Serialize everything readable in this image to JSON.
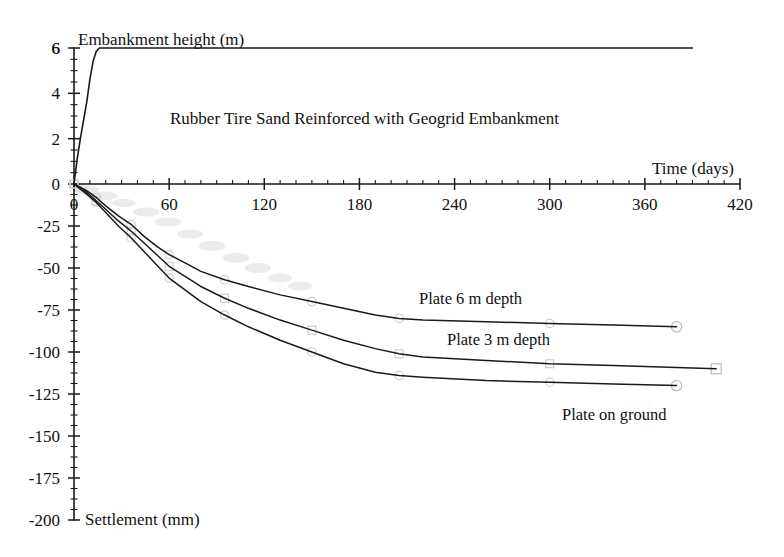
{
  "chart_data": {
    "type": "line",
    "title": "Rubber Tire Sand Reinforced with Geogrid Embankment",
    "xlabel": "Time (days)",
    "ylabel_top": "Embankment height (m)",
    "ylabel_bottom": "Settlement (mm)",
    "grid": false,
    "legend_position": "inline-annotations",
    "xlim": [
      0,
      420
    ],
    "x_ticks": [
      0,
      60,
      120,
      180,
      240,
      300,
      360,
      420
    ],
    "x_minor_step": 10,
    "y_top_axis": {
      "label": "Embankment height (m)",
      "lim": [
        0,
        6
      ],
      "ticks": [
        0,
        2,
        4,
        6
      ],
      "minor_step": 0.5
    },
    "y_bottom_axis": {
      "label": "Settlement (mm)",
      "lim": [
        -200,
        0
      ],
      "ticks": [
        0,
        -25,
        -50,
        -75,
        -100,
        -125,
        -150,
        -175,
        -200
      ],
      "minor_step": 6.25
    },
    "series": [
      {
        "name": "Embankment height",
        "axis": "top",
        "unit": "m",
        "marker": "none",
        "points": [
          [
            0,
            0.0
          ],
          [
            2,
            1.1
          ],
          [
            4,
            2.0
          ],
          [
            6,
            2.8
          ],
          [
            8,
            3.6
          ],
          [
            10,
            4.6
          ],
          [
            12,
            5.4
          ],
          [
            14,
            5.85
          ],
          [
            16,
            6.0
          ],
          [
            30,
            6.0
          ],
          [
            60,
            6.0
          ],
          [
            120,
            6.0
          ],
          [
            180,
            6.0
          ],
          [
            240,
            6.0
          ],
          [
            300,
            6.0
          ],
          [
            360,
            6.0
          ],
          [
            390,
            6.0
          ]
        ]
      },
      {
        "name": "Plate 6 m depth",
        "axis": "bottom",
        "unit": "mm",
        "marker": "circle",
        "label": "Plate 6 m depth",
        "points": [
          [
            0,
            0
          ],
          [
            4,
            -2
          ],
          [
            8,
            -4
          ],
          [
            14,
            -8
          ],
          [
            20,
            -13
          ],
          [
            28,
            -19
          ],
          [
            36,
            -24
          ],
          [
            44,
            -31
          ],
          [
            52,
            -37
          ],
          [
            60,
            -42
          ],
          [
            70,
            -47
          ],
          [
            80,
            -52
          ],
          [
            95,
            -57
          ],
          [
            110,
            -61
          ],
          [
            130,
            -66
          ],
          [
            150,
            -70
          ],
          [
            170,
            -74
          ],
          [
            190,
            -78
          ],
          [
            205,
            -80
          ],
          [
            220,
            -81
          ],
          [
            260,
            -82
          ],
          [
            300,
            -83
          ],
          [
            340,
            -84
          ],
          [
            380,
            -85
          ]
        ]
      },
      {
        "name": "Plate 3 m depth",
        "axis": "bottom",
        "unit": "mm",
        "marker": "square",
        "label": "Plate 3 m depth",
        "points": [
          [
            0,
            0
          ],
          [
            4,
            -2
          ],
          [
            8,
            -5
          ],
          [
            14,
            -10
          ],
          [
            20,
            -15
          ],
          [
            28,
            -22
          ],
          [
            36,
            -28
          ],
          [
            44,
            -35
          ],
          [
            52,
            -42
          ],
          [
            60,
            -49
          ],
          [
            70,
            -55
          ],
          [
            80,
            -61
          ],
          [
            95,
            -68
          ],
          [
            110,
            -74
          ],
          [
            130,
            -81
          ],
          [
            150,
            -87
          ],
          [
            170,
            -93
          ],
          [
            190,
            -98
          ],
          [
            205,
            -101
          ],
          [
            220,
            -103
          ],
          [
            260,
            -105
          ],
          [
            300,
            -107
          ],
          [
            340,
            -108
          ],
          [
            405,
            -110
          ]
        ]
      },
      {
        "name": "Plate on ground",
        "axis": "bottom",
        "unit": "mm",
        "marker": "circle",
        "label": "Plate on ground",
        "points": [
          [
            0,
            0
          ],
          [
            4,
            -3
          ],
          [
            8,
            -6
          ],
          [
            14,
            -11
          ],
          [
            20,
            -17
          ],
          [
            28,
            -25
          ],
          [
            36,
            -32
          ],
          [
            44,
            -40
          ],
          [
            52,
            -48
          ],
          [
            60,
            -56
          ],
          [
            70,
            -63
          ],
          [
            80,
            -70
          ],
          [
            95,
            -78
          ],
          [
            110,
            -85
          ],
          [
            130,
            -93
          ],
          [
            150,
            -100
          ],
          [
            170,
            -107
          ],
          [
            190,
            -112
          ],
          [
            205,
            -114
          ],
          [
            220,
            -115
          ],
          [
            260,
            -117
          ],
          [
            300,
            -118
          ],
          [
            340,
            -119
          ],
          [
            380,
            -120
          ]
        ]
      }
    ],
    "annotations": [
      {
        "text": "Rubber Tire Sand Reinforced with Geogrid Embankment",
        "x": 170,
        "y": 124,
        "name": "chart-title"
      },
      {
        "text": "Embankment height (m)",
        "x": 78,
        "y": 45,
        "name": "top-axis-caption"
      },
      {
        "text": "Time (days)",
        "x": 652,
        "y": 174,
        "name": "x-axis-caption"
      },
      {
        "text": "Settlement (mm)",
        "x": 85,
        "y": 525,
        "name": "bottom-axis-caption"
      },
      {
        "text": "Plate 6 m depth",
        "x": 419,
        "y": 304,
        "name": "series-label-plate-6m"
      },
      {
        "text": "Plate 3 m depth",
        "x": 447,
        "y": 345,
        "name": "series-label-plate-3m"
      },
      {
        "text": "Plate on ground",
        "x": 562,
        "y": 420,
        "name": "series-label-plate-ground"
      }
    ]
  }
}
